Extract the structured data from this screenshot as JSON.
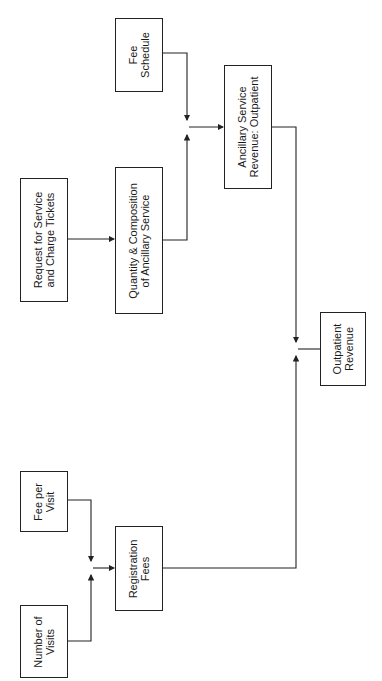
{
  "diagram": {
    "orientation": "rotated -90deg",
    "nodes": [
      {
        "id": "fee_schedule",
        "label": "Fee\nSchedule"
      },
      {
        "id": "request_service",
        "label": "Request for Service\nand Charge Tickets"
      },
      {
        "id": "quantity_composition",
        "label": "Quantity & Composition\nof Ancillary Service"
      },
      {
        "id": "ancillary_revenue",
        "label": "Ancillary Service\nRevenue: Outpatient"
      },
      {
        "id": "outpatient_revenue",
        "label": "Outpatient\nRevenue"
      },
      {
        "id": "fee_per_visit",
        "label": "Fee per\nVisit"
      },
      {
        "id": "number_of_visits",
        "label": "Number of\nVisits"
      },
      {
        "id": "registration_fees",
        "label": "Registration\nFees"
      }
    ],
    "edges": [
      {
        "from": "request_service",
        "to": "quantity_composition"
      },
      {
        "from": "quantity_composition",
        "to": "ancillary_revenue"
      },
      {
        "from": "fee_schedule",
        "to": "ancillary_revenue"
      },
      {
        "from": "fee_per_visit",
        "to": "registration_fees"
      },
      {
        "from": "number_of_visits",
        "to": "registration_fees"
      },
      {
        "from": "ancillary_revenue",
        "to": "outpatient_revenue"
      },
      {
        "from": "registration_fees",
        "to": "outpatient_revenue"
      }
    ]
  }
}
